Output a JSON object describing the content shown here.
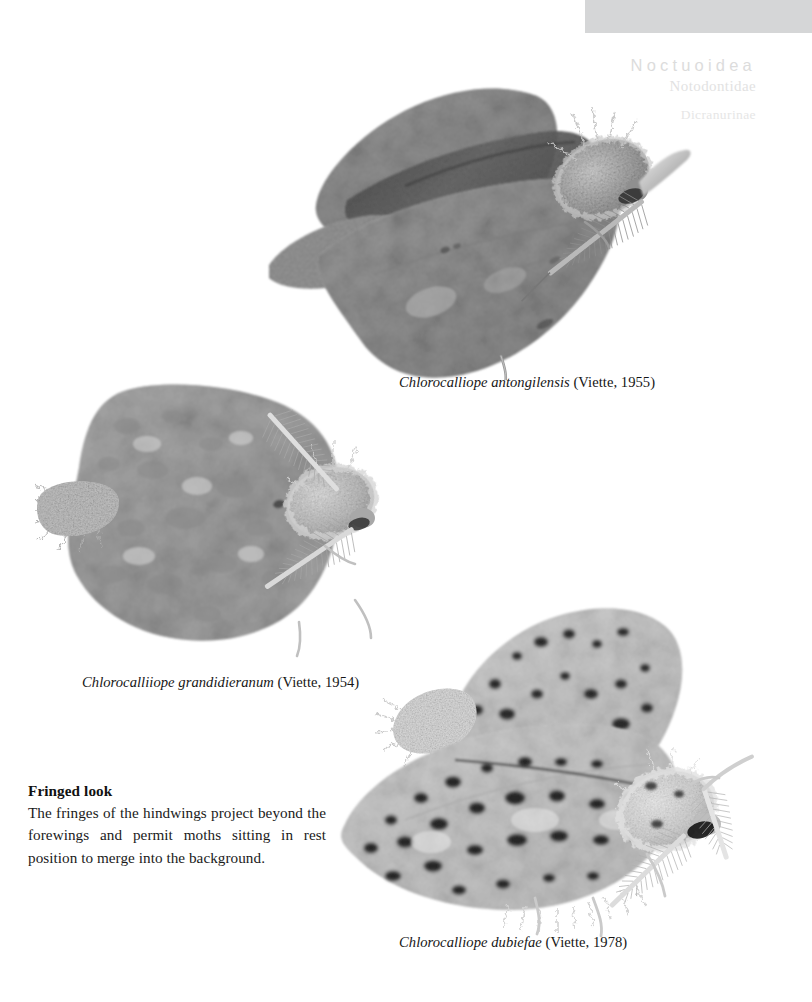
{
  "page": {
    "background_color": "#ffffff",
    "width": 812,
    "height": 1002
  },
  "header": {
    "bar_color": "#d5d6d7",
    "superfamily": "Noctuoidea",
    "family": "Notodontidae",
    "subfamily": "Dicranurinae",
    "superfamily_color": "#dcdcdc",
    "family_color": "#e2e2e2",
    "subfamily_color": "#e6e6e6"
  },
  "figures": [
    {
      "id": "moth-1",
      "caption_species": "Chlorocalliope antongilensis",
      "caption_authority": " (Viette, 1955)",
      "alt": "grayscale photograph of a mottled gray notodontid moth with bipectinate antennae, wings spread and hindwing fringes visible",
      "body_tone": "#9a9a9a"
    },
    {
      "id": "moth-2",
      "caption_species": "Chlorocalliiope grandidieranum",
      "caption_authority": " (Viette, 1954)",
      "alt": "grayscale photograph of a pale gray speckled moth at rest with feathered antennae",
      "body_tone": "#b4b4b4"
    },
    {
      "id": "moth-3",
      "caption_species": "Chlorocalliope dubiefae",
      "caption_authority": " (Viette, 1978)",
      "alt": "grayscale photograph of a whitish moth heavily spotted with black dots and long pectinate antennae",
      "body_tone": "#dcdcdc"
    }
  ],
  "note": {
    "title": "Fringed look",
    "body": "The fringes of the hindwings project beyond the forewings and permit moths sitting in rest position to merge into the background."
  }
}
